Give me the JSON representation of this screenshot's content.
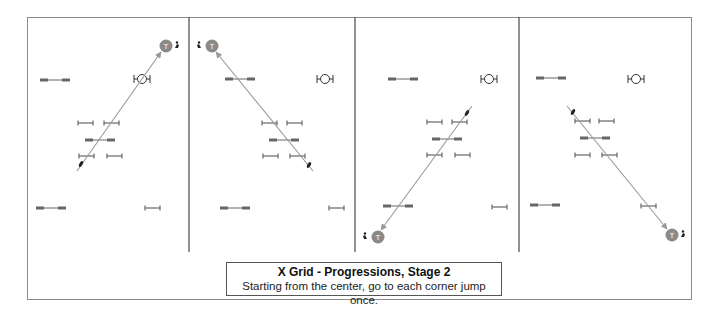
{
  "caption": {
    "title": "X Grid - Progressions, Stage 2",
    "subtitle": "Starting from the center, go to each corner jump once."
  },
  "colors": {
    "frame": "#8c8c8c",
    "divider": "#555555",
    "jump": "#666666",
    "arrow": "#999999",
    "target_fill": "#8a8a8a",
    "target_text": "#ffffff"
  },
  "dividers_x": [
    189,
    355,
    519
  ],
  "panels": [
    {
      "name": "panel-1",
      "target": {
        "x": 166,
        "y": 46,
        "label": "T",
        "icon_side": "right"
      },
      "arrow": {
        "x1": 77,
        "y1": 171,
        "x2": 161,
        "y2": 52
      },
      "horse": {
        "x": 81,
        "y": 164
      },
      "oxer": {
        "x": 142,
        "y": 79
      }
    },
    {
      "name": "panel-2",
      "target": {
        "x": 212,
        "y": 46,
        "label": "T",
        "icon_side": "left"
      },
      "arrow": {
        "x1": 313,
        "y1": 171,
        "x2": 216,
        "y2": 52
      },
      "horse": {
        "x": 309,
        "y": 165
      },
      "oxer": {
        "x": 325,
        "y": 79
      }
    },
    {
      "name": "panel-3",
      "target": {
        "x": 378,
        "y": 237,
        "label": "T",
        "icon_side": "left"
      },
      "arrow": {
        "x1": 472,
        "y1": 106,
        "x2": 381,
        "y2": 230
      },
      "horse": {
        "x": 467,
        "y": 113
      },
      "oxer": {
        "x": 489,
        "y": 79
      }
    },
    {
      "name": "panel-4",
      "target": {
        "x": 672,
        "y": 235,
        "label": "T",
        "icon_side": "right"
      },
      "arrow": {
        "x1": 567,
        "y1": 106,
        "x2": 667,
        "y2": 229
      },
      "horse": {
        "x": 573,
        "y": 112
      },
      "oxer": {
        "x": 636,
        "y": 79
      }
    }
  ],
  "panel_jumps": [
    {
      "verticals": [
        [
          78,
          123
        ],
        [
          104,
          123
        ],
        [
          79,
          156
        ],
        [
          107,
          156
        ],
        [
          145,
          208
        ]
      ],
      "doubles": [
        [
          40,
          80
        ],
        [
          85,
          140
        ],
        [
          36,
          208
        ]
      ]
    },
    {
      "verticals": [
        [
          262,
          123
        ],
        [
          287,
          123
        ],
        [
          263,
          156
        ],
        [
          290,
          156
        ],
        [
          329,
          208
        ]
      ],
      "doubles": [
        [
          225,
          79
        ],
        [
          269,
          140
        ],
        [
          220,
          208
        ]
      ]
    },
    {
      "verticals": [
        [
          427,
          122
        ],
        [
          452,
          122
        ],
        [
          427,
          155
        ],
        [
          455,
          155
        ],
        [
          492,
          207
        ]
      ],
      "doubles": [
        [
          388,
          79
        ],
        [
          432,
          139
        ],
        [
          383,
          206
        ]
      ]
    },
    {
      "verticals": [
        [
          575,
          121
        ],
        [
          599,
          121
        ],
        [
          575,
          155
        ],
        [
          602,
          155
        ],
        [
          641,
          206
        ]
      ],
      "doubles": [
        [
          536,
          78
        ],
        [
          580,
          138
        ],
        [
          530,
          205
        ]
      ]
    }
  ]
}
